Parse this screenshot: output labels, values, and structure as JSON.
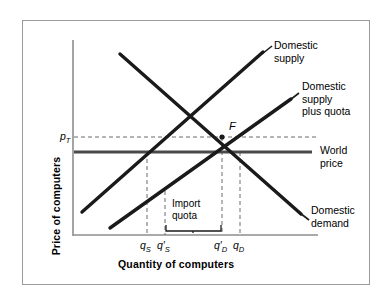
{
  "figure": {
    "type": "economics-diagram",
    "axes": {
      "x_title": "Quantity of computers",
      "y_title": "Price of computers"
    },
    "curve_labels": {
      "domestic_supply": "Domestic\nsupply",
      "domestic_supply_line1": "Domestic",
      "domestic_supply_line2": "supply",
      "supply_plus_quota_line1": "Domestic",
      "supply_plus_quota_line2": "supply",
      "supply_plus_quota_line3": "plus quota",
      "world_price_line1": "World",
      "world_price_line2": "price",
      "domestic_demand_line1": "Domestic",
      "domestic_demand_line2": "demand"
    },
    "annotations": {
      "price_tariff": "p",
      "price_tariff_sub": "T",
      "equilibrium_point": "F",
      "quota_line1": "Import",
      "quota_line2": "quota"
    },
    "x_ticks": [
      {
        "base": "q",
        "sub": "S",
        "prime": false
      },
      {
        "base": "q",
        "sub": "S",
        "prime": true
      },
      {
        "base": "q",
        "sub": "D",
        "prime": true
      },
      {
        "base": "q",
        "sub": "D",
        "prime": false
      }
    ],
    "colors": {
      "curve": "#1a1a1a",
      "world_price": "#555555",
      "dashed": "#555555",
      "frame": "#9a9a9a",
      "axis": "#888888",
      "background": "#ffffff"
    }
  },
  "chart_data": {
    "type": "line",
    "title": "",
    "xlabel": "Quantity of computers",
    "ylabel": "Price of computers",
    "grid": false,
    "legend": "inline-right",
    "series": [
      {
        "name": "Domestic supply",
        "points": [
          [
            82,
            212
          ],
          [
            262,
            53
          ]
        ],
        "slope": "upward"
      },
      {
        "name": "Domestic supply plus quota",
        "points": [
          [
            110,
            228
          ],
          [
            290,
            100
          ]
        ],
        "slope": "upward"
      },
      {
        "name": "Domestic demand",
        "points": [
          [
            120,
            55
          ],
          [
            300,
            214
          ]
        ],
        "slope": "downward"
      },
      {
        "name": "World price",
        "points": [
          [
            74,
            152
          ],
          [
            352,
            152
          ]
        ],
        "slope": "horizontal"
      }
    ],
    "annotations": [
      {
        "label": "p_T",
        "type": "price-level",
        "y": 137
      },
      {
        "label": "F",
        "type": "equilibrium-point",
        "x": 222,
        "y": 137
      },
      {
        "label": "Import quota",
        "type": "bracket",
        "from_x": 165,
        "to_x": 222
      }
    ],
    "x_tick_positions": [
      147,
      165,
      222,
      240
    ],
    "x_tick_labels": [
      "qS",
      "q'S",
      "q'D",
      "qD"
    ]
  }
}
